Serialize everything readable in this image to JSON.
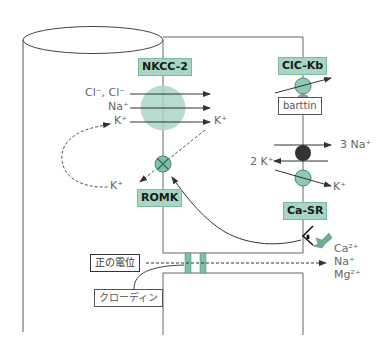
{
  "diagram": {
    "transporters": {
      "nkcc2": {
        "label": "NKCC-2"
      },
      "romk": {
        "label": "ROMK"
      },
      "clckb": {
        "label": "ClC-Kb"
      },
      "barttin": {
        "label": "barttin"
      },
      "casr": {
        "label": "Ca-SR"
      },
      "claudin": {
        "label": "クローディン"
      },
      "positive_potential": {
        "label": "正の電位"
      }
    },
    "ions": {
      "nkcc_cl": "Cl⁻, Cl⁻",
      "nkcc_na": "Na⁺",
      "nkcc_k_left": "K⁺",
      "nkcc_k_right": "K⁺",
      "romk_k": "K⁺",
      "pump_na": "3 Na⁺",
      "pump_k": "2 K⁺",
      "kchannel_k": "K⁺",
      "ca": "Ca²⁺",
      "na": "Na⁺",
      "mg": "Mg²⁺"
    },
    "colors": {
      "green_fill": "#a9d6c4",
      "green_dark": "#6fae94",
      "pump_dark": "#333333",
      "line": "#555555"
    }
  }
}
